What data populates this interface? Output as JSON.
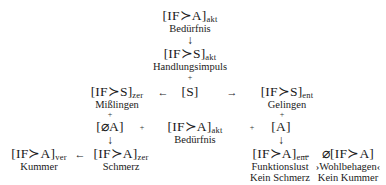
{
  "nodes": {
    "need": {
      "formula": "[IF≻A]",
      "sub": "akt",
      "label": "Bedürfnis"
    },
    "impulse": {
      "formula": "[IF≻S]",
      "sub": "akt",
      "label": "Handlungsimpuls"
    },
    "s": {
      "formula": "[S]"
    },
    "failure": {
      "formula": "[IF≻S]",
      "sub": "zer",
      "label": "Mißlingen"
    },
    "success": {
      "formula": "[IF≻S]",
      "sub": "ent",
      "label": "Gelingen"
    },
    "nota": {
      "formula": "[⌀A]"
    },
    "need2": {
      "formula": "[IF≻A]",
      "sub": "akt",
      "label": "Bedürfnis"
    },
    "a": {
      "formula": "[A]"
    },
    "grief": {
      "formula": "[IF≻A]",
      "sub": "ver",
      "label": "Kummer"
    },
    "pain": {
      "formula": "[IF≻A]",
      "sub": "zer",
      "label": "Schmerz"
    },
    "pleasure": {
      "formula": "[IF≻A]",
      "sub": "ent",
      "label": "Funktionslust",
      "label2": "Kein Schmerz"
    },
    "wellbeing": {
      "formula": "⌀[IF≻A]",
      "label": "›Wohlbehagen‹",
      "label2": "Kein Kummer"
    }
  },
  "symbols": {
    "down": "↓",
    "left": "←",
    "right": "→",
    "plus": "+"
  }
}
